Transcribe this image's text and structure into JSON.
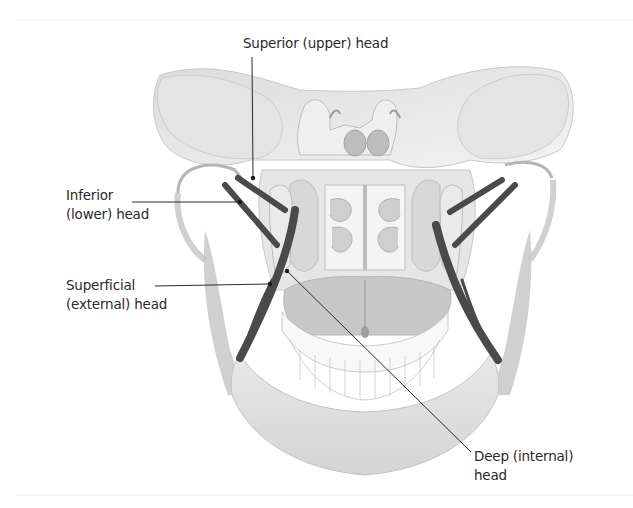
{
  "figure": {
    "colors": {
      "background": "#ffffff",
      "bone_light": "#e9e9e9",
      "bone_mid": "#cfcfcf",
      "bone_shadow": "#a9a9a9",
      "muscle": "#4a4a4a",
      "leader_line": "#2a2a2a",
      "label_text": "#2a2a2a"
    },
    "labels": {
      "superior": {
        "line1": "Superior (upper) head"
      },
      "inferior": {
        "line1": "Inferior",
        "line2": "(lower) head"
      },
      "superficial": {
        "line1": "Superficial",
        "line2": "(external) head"
      },
      "deep": {
        "line1": "Deep (internal)",
        "line2": "head"
      }
    }
  }
}
